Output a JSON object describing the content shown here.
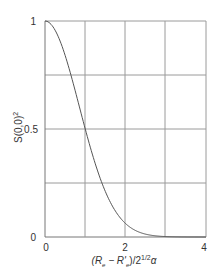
{
  "chart_data": {
    "type": "line",
    "title": "",
    "xlabel": "(R_e − R'_e)/2^{1/2}α",
    "ylabel": "S(0,0)²",
    "xlim": [
      0,
      4
    ],
    "ylim": [
      0,
      1
    ],
    "x_ticks": [
      "0",
      "2",
      "4"
    ],
    "y_ticks": [
      "0",
      "0.5",
      "1"
    ],
    "grid": true,
    "legend": null,
    "series": [
      {
        "name": "S(0,0)^2",
        "x": [
          0,
          0.25,
          0.5,
          0.75,
          1.0,
          1.25,
          1.5,
          1.75,
          2.0,
          2.5,
          3.0,
          3.5,
          4.0
        ],
        "values": [
          1.0,
          0.958,
          0.841,
          0.677,
          0.5,
          0.338,
          0.21,
          0.12,
          0.0625,
          0.013,
          0.002,
          0.0002,
          0.0
        ]
      }
    ]
  },
  "labels": {
    "y_axis_main": "S(0,0)",
    "y_axis_sup": "2",
    "x_axis_part1": "(R",
    "x_axis_sub1": "e",
    "x_axis_part2": " − R'",
    "x_axis_sub2": "e",
    "x_axis_part3": ")/2",
    "x_axis_sup": "1/2",
    "x_axis_part4": "α",
    "ytick_1": "1",
    "ytick_05": "0.5",
    "ytick_0": "0",
    "xtick_0": "0",
    "xtick_2": "2",
    "xtick_4": "4"
  },
  "colors": {
    "grid": "#9a9a9a",
    "curve": "#555555",
    "text": "#333333"
  }
}
